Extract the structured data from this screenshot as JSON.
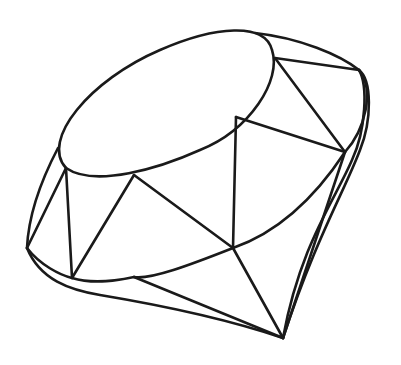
{
  "figure": {
    "colors": {
      "stroke": "#1a1a1a",
      "background": "#ffffff"
    }
  }
}
